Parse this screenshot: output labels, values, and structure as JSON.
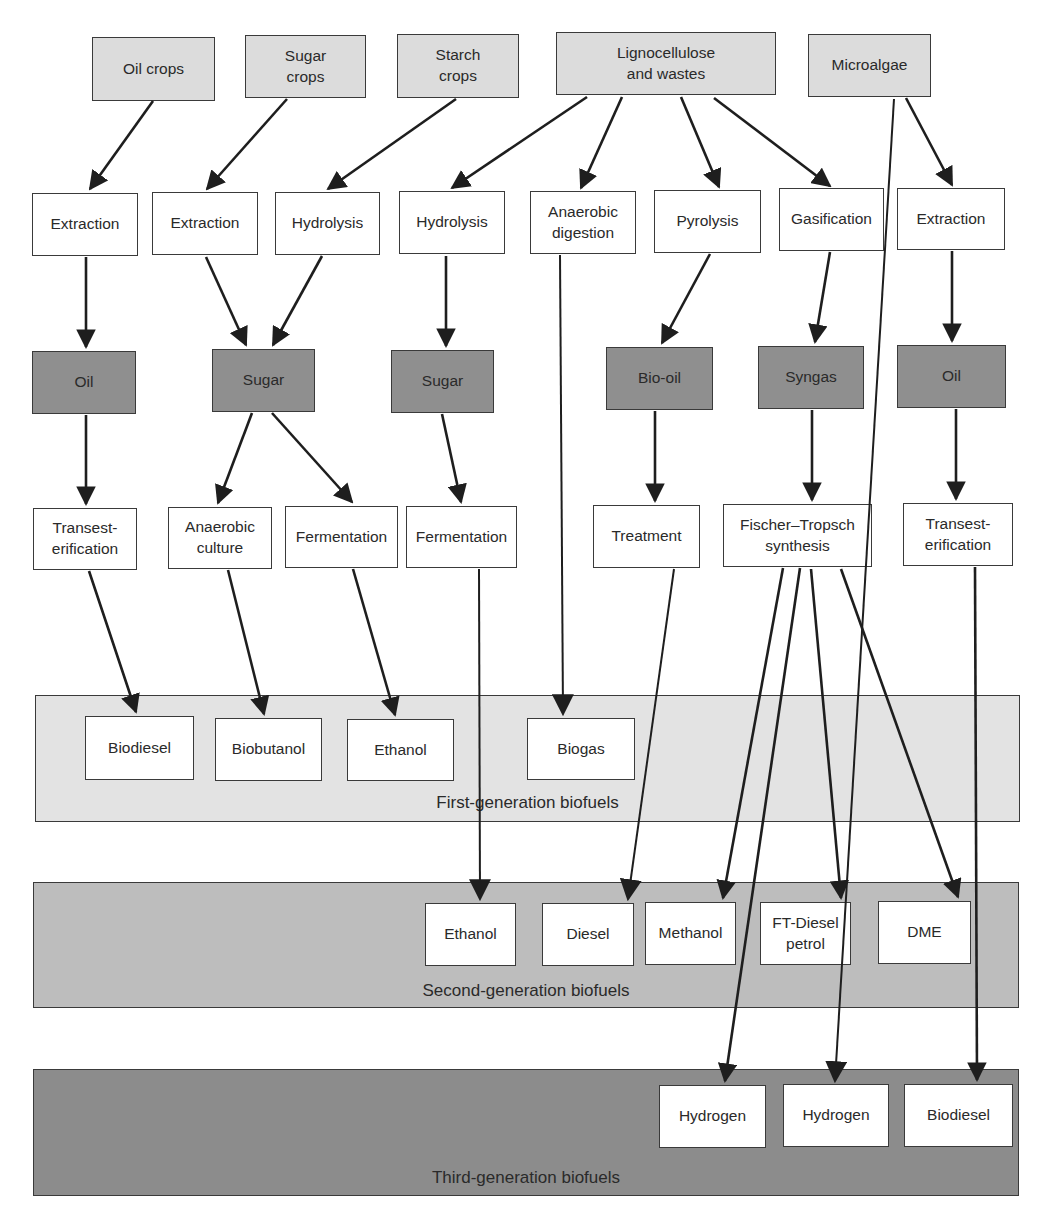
{
  "colors": {
    "source_fill": "#dcdcdc",
    "process_fill": "#ffffff",
    "intermediate_fill": "#8f8f8f",
    "first_gen_band": "#e3e3e3",
    "second_gen_band": "#bdbdbd",
    "third_gen_band": "#8c8c8c",
    "line": "#1e1e1e"
  },
  "bands": [
    {
      "id": "first",
      "label": "First-generation biofuels",
      "x": 35,
      "y": 695,
      "w": 985,
      "h": 127,
      "fill": "#e3e3e3",
      "label_y": 97
    },
    {
      "id": "second",
      "label": "Second-generation biofuels",
      "x": 33,
      "y": 882,
      "w": 986,
      "h": 126,
      "fill": "#bdbdbd",
      "label_y": 98
    },
    {
      "id": "third",
      "label": "Third-generation biofuels",
      "x": 33,
      "y": 1069,
      "w": 986,
      "h": 127,
      "fill": "#8c8c8c",
      "label_y": 98
    }
  ],
  "nodes": [
    {
      "id": "oil-crops",
      "label": "Oil crops",
      "type": "source",
      "x": 92,
      "y": 37,
      "w": 123,
      "h": 64
    },
    {
      "id": "sugar-crops",
      "label": "Sugar\ncrops",
      "type": "source",
      "x": 245,
      "y": 35,
      "w": 121,
      "h": 63
    },
    {
      "id": "starch-crops",
      "label": "Starch\ncrops",
      "type": "source",
      "x": 397,
      "y": 34,
      "w": 122,
      "h": 64
    },
    {
      "id": "lignocellulose",
      "label": "Lignocellulose\nand wastes",
      "type": "source",
      "x": 556,
      "y": 32,
      "w": 220,
      "h": 63
    },
    {
      "id": "microalgae",
      "label": "Microalgae",
      "type": "source",
      "x": 808,
      "y": 34,
      "w": 123,
      "h": 63
    },
    {
      "id": "extraction-1",
      "label": "Extraction",
      "type": "process",
      "x": 32,
      "y": 193,
      "w": 106,
      "h": 63
    },
    {
      "id": "extraction-2",
      "label": "Extraction",
      "type": "process",
      "x": 152,
      "y": 192,
      "w": 106,
      "h": 63
    },
    {
      "id": "hydrolysis-1",
      "label": "Hydrolysis",
      "type": "process",
      "x": 275,
      "y": 192,
      "w": 105,
      "h": 63
    },
    {
      "id": "hydrolysis-2",
      "label": "Hydrolysis",
      "type": "process",
      "x": 399,
      "y": 191,
      "w": 106,
      "h": 63
    },
    {
      "id": "anaerobic-digestion",
      "label": "Anaerobic\ndigestion",
      "type": "process",
      "x": 530,
      "y": 191,
      "w": 106,
      "h": 63
    },
    {
      "id": "pyrolysis",
      "label": "Pyrolysis",
      "type": "process",
      "x": 654,
      "y": 190,
      "w": 107,
      "h": 63
    },
    {
      "id": "gasification",
      "label": "Gasification",
      "type": "process",
      "x": 779,
      "y": 188,
      "w": 105,
      "h": 63
    },
    {
      "id": "extraction-3",
      "label": "Extraction",
      "type": "process",
      "x": 897,
      "y": 188,
      "w": 108,
      "h": 62
    },
    {
      "id": "oil-1",
      "label": "Oil",
      "type": "product",
      "x": 32,
      "y": 351,
      "w": 104,
      "h": 63
    },
    {
      "id": "sugar-1",
      "label": "Sugar",
      "type": "product",
      "x": 212,
      "y": 349,
      "w": 103,
      "h": 63
    },
    {
      "id": "sugar-2",
      "label": "Sugar",
      "type": "product",
      "x": 391,
      "y": 350,
      "w": 103,
      "h": 63
    },
    {
      "id": "bio-oil",
      "label": "Bio-oil",
      "type": "product",
      "x": 606,
      "y": 347,
      "w": 107,
      "h": 63
    },
    {
      "id": "syngas",
      "label": "Syngas",
      "type": "product",
      "x": 758,
      "y": 346,
      "w": 106,
      "h": 63
    },
    {
      "id": "oil-2",
      "label": "Oil",
      "type": "product",
      "x": 897,
      "y": 345,
      "w": 109,
      "h": 63
    },
    {
      "id": "transesterification-1",
      "label": "Transest-\nerification",
      "type": "process",
      "x": 33,
      "y": 508,
      "w": 104,
      "h": 62
    },
    {
      "id": "anaerobic-culture",
      "label": "Anaerobic\nculture",
      "type": "process",
      "x": 168,
      "y": 507,
      "w": 104,
      "h": 62
    },
    {
      "id": "fermentation-1",
      "label": "Fermentation",
      "type": "process",
      "x": 285,
      "y": 506,
      "w": 113,
      "h": 62
    },
    {
      "id": "fermentation-2",
      "label": "Fermentation",
      "type": "process",
      "x": 406,
      "y": 506,
      "w": 111,
      "h": 62
    },
    {
      "id": "treatment",
      "label": "Treatment",
      "type": "process",
      "x": 593,
      "y": 505,
      "w": 107,
      "h": 63
    },
    {
      "id": "fischer-tropsch",
      "label": "Fischer–Tropsch\nsynthesis",
      "type": "process",
      "x": 723,
      "y": 504,
      "w": 149,
      "h": 63
    },
    {
      "id": "transesterification-2",
      "label": "Transest-\nerification",
      "type": "process",
      "x": 903,
      "y": 503,
      "w": 110,
      "h": 63
    },
    {
      "id": "fg-biodiesel",
      "label": "Biodiesel",
      "type": "fuel",
      "x": 85,
      "y": 716,
      "w": 109,
      "h": 64
    },
    {
      "id": "fg-biobutanol",
      "label": "Biobutanol",
      "type": "fuel",
      "x": 215,
      "y": 718,
      "w": 107,
      "h": 63
    },
    {
      "id": "fg-ethanol",
      "label": "Ethanol",
      "type": "fuel",
      "x": 347,
      "y": 719,
      "w": 107,
      "h": 62
    },
    {
      "id": "fg-biogas",
      "label": "Biogas",
      "type": "fuel",
      "x": 527,
      "y": 718,
      "w": 108,
      "h": 62
    },
    {
      "id": "sg-ethanol",
      "label": "Ethanol",
      "type": "fuel",
      "x": 425,
      "y": 903,
      "w": 91,
      "h": 63
    },
    {
      "id": "sg-diesel",
      "label": "Diesel",
      "type": "fuel",
      "x": 542,
      "y": 903,
      "w": 92,
      "h": 63
    },
    {
      "id": "sg-methanol",
      "label": "Methanol",
      "type": "fuel",
      "x": 645,
      "y": 902,
      "w": 91,
      "h": 63
    },
    {
      "id": "sg-ft-diesel",
      "label": "FT-Diesel\npetrol",
      "type": "fuel",
      "x": 760,
      "y": 902,
      "w": 91,
      "h": 63
    },
    {
      "id": "sg-dme",
      "label": "DME",
      "type": "fuel",
      "x": 878,
      "y": 901,
      "w": 93,
      "h": 63
    },
    {
      "id": "tg-hydrogen-1",
      "label": "Hydrogen",
      "type": "fuel",
      "x": 659,
      "y": 1085,
      "w": 107,
      "h": 63
    },
    {
      "id": "tg-hydrogen-2",
      "label": "Hydrogen",
      "type": "fuel",
      "x": 783,
      "y": 1084,
      "w": 106,
      "h": 63
    },
    {
      "id": "tg-biodiesel",
      "label": "Biodiesel",
      "type": "fuel",
      "x": 904,
      "y": 1084,
      "w": 109,
      "h": 63
    }
  ],
  "edges": [
    {
      "from": "oil-crops",
      "to": "extraction-1",
      "x1": 153,
      "y1": 101,
      "x2": 90,
      "y2": 189
    },
    {
      "from": "sugar-crops",
      "to": "extraction-2",
      "x1": 287,
      "y1": 99,
      "x2": 207,
      "y2": 189
    },
    {
      "from": "starch-crops",
      "to": "hydrolysis-1",
      "x1": 456,
      "y1": 99,
      "x2": 328,
      "y2": 189
    },
    {
      "from": "lignocellulose",
      "to": "hydrolysis-2",
      "x1": 587,
      "y1": 97,
      "x2": 452,
      "y2": 188
    },
    {
      "from": "lignocellulose",
      "to": "anaerobic-digestion",
      "x1": 622,
      "y1": 97,
      "x2": 581,
      "y2": 188
    },
    {
      "from": "lignocellulose",
      "to": "pyrolysis",
      "x1": 681,
      "y1": 97,
      "x2": 719,
      "y2": 187
    },
    {
      "from": "lignocellulose",
      "to": "gasification",
      "x1": 714,
      "y1": 98,
      "x2": 830,
      "y2": 186
    },
    {
      "from": "microalgae",
      "to": "extraction-3",
      "x1": 906,
      "y1": 98,
      "x2": 952,
      "y2": 185
    },
    {
      "from": "microalgae",
      "to": "tg-hydrogen-2",
      "x1": 894,
      "y1": 99,
      "x2": 835,
      "y2": 1081,
      "thin": true
    },
    {
      "from": "extraction-1",
      "to": "oil-1",
      "x1": 86,
      "y1": 257,
      "x2": 86,
      "y2": 347
    },
    {
      "from": "extraction-2",
      "to": "sugar-1",
      "x1": 206,
      "y1": 257,
      "x2": 246,
      "y2": 345
    },
    {
      "from": "hydrolysis-1",
      "to": "sugar-1",
      "x1": 322,
      "y1": 256,
      "x2": 273,
      "y2": 345
    },
    {
      "from": "hydrolysis-2",
      "to": "sugar-2",
      "x1": 446,
      "y1": 256,
      "x2": 446,
      "y2": 346
    },
    {
      "from": "anaerobic-digestion",
      "to": "fg-biogas",
      "x1": 560,
      "y1": 255,
      "x2": 563,
      "y2": 714,
      "thin": true
    },
    {
      "from": "pyrolysis",
      "to": "bio-oil",
      "x1": 710,
      "y1": 254,
      "x2": 662,
      "y2": 343
    },
    {
      "from": "gasification",
      "to": "syngas",
      "x1": 830,
      "y1": 252,
      "x2": 815,
      "y2": 342
    },
    {
      "from": "extraction-3",
      "to": "oil-2",
      "x1": 952,
      "y1": 251,
      "x2": 952,
      "y2": 341
    },
    {
      "from": "oil-1",
      "to": "transesterification-1",
      "x1": 86,
      "y1": 415,
      "x2": 86,
      "y2": 504
    },
    {
      "from": "sugar-1",
      "to": "anaerobic-culture",
      "x1": 252,
      "y1": 413,
      "x2": 218,
      "y2": 503
    },
    {
      "from": "sugar-1",
      "to": "fermentation-1",
      "x1": 272,
      "y1": 413,
      "x2": 352,
      "y2": 502
    },
    {
      "from": "sugar-2",
      "to": "fermentation-2",
      "x1": 442,
      "y1": 414,
      "x2": 461,
      "y2": 502
    },
    {
      "from": "bio-oil",
      "to": "treatment",
      "x1": 655,
      "y1": 411,
      "x2": 655,
      "y2": 501
    },
    {
      "from": "syngas",
      "to": "fischer-tropsch",
      "x1": 812,
      "y1": 410,
      "x2": 812,
      "y2": 500
    },
    {
      "from": "oil-2",
      "to": "transesterification-2",
      "x1": 956,
      "y1": 409,
      "x2": 956,
      "y2": 499
    },
    {
      "from": "transesterification-1",
      "to": "fg-biodiesel",
      "x1": 89,
      "y1": 571,
      "x2": 136,
      "y2": 712
    },
    {
      "from": "anaerobic-culture",
      "to": "fg-biobutanol",
      "x1": 228,
      "y1": 570,
      "x2": 264,
      "y2": 714
    },
    {
      "from": "fermentation-1",
      "to": "fg-ethanol",
      "x1": 353,
      "y1": 569,
      "x2": 395,
      "y2": 715
    },
    {
      "from": "fermentation-2",
      "to": "sg-ethanol",
      "x1": 479,
      "y1": 569,
      "x2": 480,
      "y2": 899,
      "thin": true
    },
    {
      "from": "treatment",
      "to": "sg-diesel",
      "x1": 674,
      "y1": 569,
      "x2": 628,
      "y2": 899,
      "thin": true
    },
    {
      "from": "fischer-tropsch",
      "to": "sg-methanol",
      "x1": 783,
      "y1": 568,
      "x2": 723,
      "y2": 898
    },
    {
      "from": "fischer-tropsch",
      "to": "tg-hydrogen-1",
      "x1": 800,
      "y1": 568,
      "x2": 725,
      "y2": 1081
    },
    {
      "from": "fischer-tropsch",
      "to": "sg-ft-diesel",
      "x1": 811,
      "y1": 569,
      "x2": 841,
      "y2": 898
    },
    {
      "from": "fischer-tropsch",
      "to": "sg-dme",
      "x1": 841,
      "y1": 569,
      "x2": 958,
      "y2": 897
    },
    {
      "from": "transesterification-2",
      "to": "tg-biodiesel",
      "x1": 975,
      "y1": 567,
      "x2": 977,
      "y2": 1080
    }
  ]
}
